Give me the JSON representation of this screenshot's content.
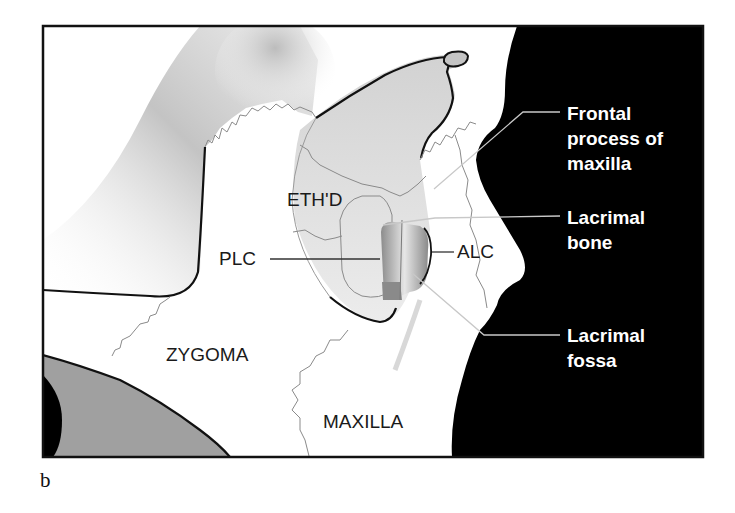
{
  "figure": {
    "panel_letter": "b",
    "colors": {
      "frame": "#111111",
      "soft_tissue_black": "#000000",
      "bone_white": "#ffffff",
      "shadow_gray": "#c8c8c8",
      "dark_gray_region": "#a0a0a0",
      "orbit_fill": "#dcdcdc",
      "lacrimal_fossa_gray": "#9a9a9a",
      "suture_line": "#8a8a8a",
      "label_on_white": "#1a1a1a",
      "label_on_black": "#ffffff"
    },
    "region_labels": {
      "ethmoid": "ETH'D",
      "zygoma": "ZYGOMA",
      "maxilla": "MAXILLA",
      "plc": "PLC",
      "alc": "ALC"
    },
    "callouts": [
      {
        "id": "frontal-process",
        "lines": [
          "Frontal",
          "process of",
          "maxilla"
        ]
      },
      {
        "id": "lacrimal-bone",
        "lines": [
          "Lacrimal",
          "bone"
        ]
      },
      {
        "id": "lacrimal-fossa",
        "lines": [
          "Lacrimal",
          "fossa"
        ]
      }
    ]
  }
}
